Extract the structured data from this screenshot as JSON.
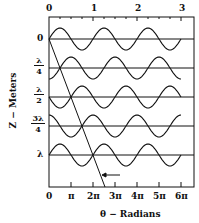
{
  "figure": {
    "top_axis": {
      "ticks": [
        "0",
        "1",
        "2",
        "3"
      ]
    },
    "bottom_axis": {
      "ticks": [
        "0",
        "π",
        "2π",
        "3π",
        "4π",
        "5π",
        "6π"
      ],
      "label": "θ − Radians"
    },
    "left_axis": {
      "label": "Z − Meters",
      "rows": [
        {
          "num": "0",
          "den": ""
        },
        {
          "num": "λ",
          "den": "4"
        },
        {
          "num": "λ",
          "den": "2"
        },
        {
          "num": "3λ",
          "den": "4"
        },
        {
          "num": "λ",
          "den": ""
        }
      ]
    },
    "waves": [
      {
        "z": "0",
        "phase": "sin"
      },
      {
        "z": "λ/4",
        "phase": "-cos"
      },
      {
        "z": "λ/2",
        "phase": "-sin"
      },
      {
        "z": "3λ/4",
        "phase": "cos"
      },
      {
        "z": "λ",
        "phase": "sin"
      }
    ],
    "colors": {
      "ink": "#111111",
      "background": "#ffffff"
    }
  }
}
